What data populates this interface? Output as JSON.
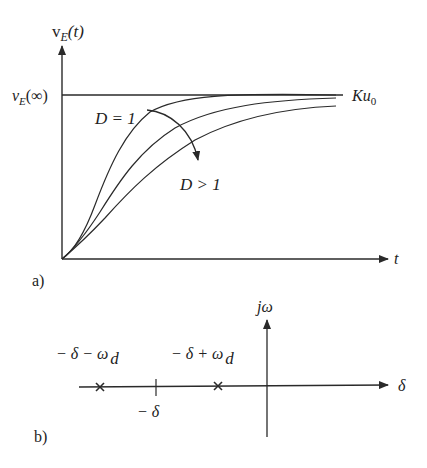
{
  "figure": {
    "panel_a": {
      "label": "a)",
      "y_axis_label": {
        "main": "v",
        "sub": "E",
        "rest": "(t)"
      },
      "x_axis_label": "t",
      "steady_state_label": {
        "main": "v",
        "sub": "E",
        "rest": "(∞)"
      },
      "asymptote_label": {
        "main": "Ku",
        "sub": "0"
      },
      "curve_label_critical": "D = 1",
      "curve_label_overdamped": "D > 1",
      "curves": [
        {
          "name": "D = 1",
          "description": "critically damped, fastest rise"
        },
        {
          "name": "D > 1 (moderate)",
          "description": "overdamped"
        },
        {
          "name": "D > 1 (strong)",
          "description": "overdamped, slowest rise"
        }
      ]
    },
    "panel_b": {
      "label": "b)",
      "imag_axis_label": "jω",
      "real_axis_label": "δ",
      "pole_1_label": {
        "main": "− δ − ω",
        "sub": "d"
      },
      "pole_2_label": {
        "main": "− δ + ω",
        "sub": "d"
      },
      "center_tick_label": "− δ"
    },
    "colors": {
      "line": "#2a2a2a",
      "text": "#222222",
      "background": "#ffffff"
    }
  }
}
